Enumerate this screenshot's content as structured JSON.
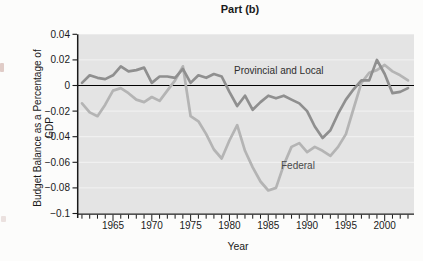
{
  "figure": {
    "title": "Part (b)"
  },
  "chart_data": {
    "type": "line",
    "title": "Part (b)",
    "xlabel": "Year",
    "ylabel": "Budget Balance as a Percentage of GDP",
    "x_range": [
      1961,
      2003
    ],
    "ylim": [
      -0.1,
      0.04
    ],
    "y_ticks": [
      0.04,
      0.02,
      0,
      -0.02,
      -0.04,
      -0.06,
      -0.08,
      -0.1
    ],
    "y_tick_labels": [
      "0.04",
      "0.02",
      "0",
      "−0.02",
      "−0.04",
      "−0.06",
      "−0.08",
      "−0.1"
    ],
    "x_major_ticks": [
      1965,
      1970,
      1975,
      1980,
      1985,
      1990,
      1995,
      2000
    ],
    "x_minor_tick_interval": 1,
    "grid": true,
    "zero_line": true,
    "legend_position": "inline-annotations",
    "x": [
      1961,
      1962,
      1963,
      1964,
      1965,
      1966,
      1967,
      1968,
      1969,
      1970,
      1971,
      1972,
      1973,
      1974,
      1975,
      1976,
      1977,
      1978,
      1979,
      1980,
      1981,
      1982,
      1983,
      1984,
      1985,
      1986,
      1987,
      1988,
      1989,
      1990,
      1991,
      1992,
      1993,
      1994,
      1995,
      1996,
      1997,
      1998,
      1999,
      2000,
      2001,
      2002,
      2003
    ],
    "series": [
      {
        "name": "Provincial and Local",
        "color": "#8f8f8f",
        "values": [
          0.002,
          0.008,
          0.006,
          0.005,
          0.008,
          0.015,
          0.011,
          0.012,
          0.014,
          0.002,
          0.007,
          0.007,
          0.006,
          0.013,
          0.002,
          0.008,
          0.006,
          0.009,
          0.007,
          -0.005,
          -0.016,
          -0.008,
          -0.019,
          -0.013,
          -0.008,
          -0.01,
          -0.008,
          -0.011,
          -0.014,
          -0.02,
          -0.032,
          -0.041,
          -0.035,
          -0.022,
          -0.011,
          -0.003,
          0.004,
          0.004,
          0.02,
          0.009,
          -0.006,
          -0.005,
          -0.002
        ]
      },
      {
        "name": "Federal",
        "color": "#b4b4b4",
        "values": [
          -0.014,
          -0.021,
          -0.024,
          -0.015,
          -0.004,
          -0.002,
          -0.006,
          -0.011,
          -0.013,
          -0.009,
          -0.012,
          -0.004,
          0.004,
          0.015,
          -0.024,
          -0.028,
          -0.038,
          -0.05,
          -0.057,
          -0.043,
          -0.031,
          -0.051,
          -0.064,
          -0.075,
          -0.082,
          -0.08,
          -0.062,
          -0.048,
          -0.045,
          -0.052,
          -0.048,
          -0.051,
          -0.055,
          -0.048,
          -0.038,
          -0.018,
          0.002,
          0.01,
          0.012,
          0.016,
          0.011,
          0.008,
          0.004
        ]
      }
    ],
    "annotations": [
      {
        "text": "Provincial and Local",
        "attached_to": "Provincial and Local"
      },
      {
        "text": "Federal",
        "attached_to": "Federal"
      }
    ],
    "colors": {
      "plot_bg": "#e4e4e4",
      "gridline": "#f3f3f3",
      "axis": "#1a1a1a",
      "zero_line": "#000000",
      "text": "#1a1a1a"
    }
  }
}
